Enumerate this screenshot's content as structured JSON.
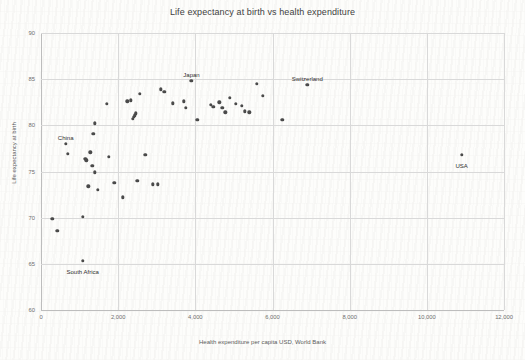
{
  "chart_data": {
    "type": "scatter",
    "title": "Life expectancy at birth vs health expenditure",
    "xlabel": "Health expenditure per capita USD, World Bank",
    "ylabel": "Life expectancy at birth",
    "xlim": [
      0,
      12000
    ],
    "ylim": [
      60,
      90
    ],
    "xticks": [
      0,
      2000,
      4000,
      6000,
      8000,
      10000,
      12000
    ],
    "xticklabels": [
      "0",
      "2,000",
      "4,000",
      "6,000",
      "8,000",
      "10,000",
      "12,000"
    ],
    "yticks": [
      60,
      65,
      70,
      75,
      80,
      85,
      90
    ],
    "yticklabels": [
      "60",
      "65",
      "70",
      "75",
      "80",
      "85",
      "90"
    ],
    "grid": true,
    "legend": false,
    "marker_color": "#4a4a4a",
    "grid_color": "#d9d9d9",
    "points": [
      {
        "x": 290,
        "y": 69.9
      },
      {
        "x": 420,
        "y": 68.6
      },
      {
        "x": 640,
        "y": 78.0
      },
      {
        "x": 700,
        "y": 76.9
      },
      {
        "x": 1080,
        "y": 70.1
      },
      {
        "x": 1080,
        "y": 65.3
      },
      {
        "x": 1150,
        "y": 76.4
      },
      {
        "x": 1170,
        "y": 76.2
      },
      {
        "x": 1230,
        "y": 73.4
      },
      {
        "x": 1280,
        "y": 77.1
      },
      {
        "x": 1330,
        "y": 75.6
      },
      {
        "x": 1360,
        "y": 79.1
      },
      {
        "x": 1390,
        "y": 80.2
      },
      {
        "x": 1400,
        "y": 74.9
      },
      {
        "x": 1480,
        "y": 73.0
      },
      {
        "x": 1700,
        "y": 82.3
      },
      {
        "x": 1760,
        "y": 76.6
      },
      {
        "x": 1900,
        "y": 73.8
      },
      {
        "x": 2120,
        "y": 72.2
      },
      {
        "x": 2240,
        "y": 82.6
      },
      {
        "x": 2320,
        "y": 82.7
      },
      {
        "x": 2380,
        "y": 80.7
      },
      {
        "x": 2400,
        "y": 80.9
      },
      {
        "x": 2430,
        "y": 81.1
      },
      {
        "x": 2460,
        "y": 81.3
      },
      {
        "x": 2500,
        "y": 74.0
      },
      {
        "x": 2560,
        "y": 83.4
      },
      {
        "x": 2700,
        "y": 76.8
      },
      {
        "x": 2900,
        "y": 73.6
      },
      {
        "x": 3020,
        "y": 73.6
      },
      {
        "x": 3100,
        "y": 83.9
      },
      {
        "x": 3200,
        "y": 83.6
      },
      {
        "x": 3420,
        "y": 82.4
      },
      {
        "x": 3700,
        "y": 82.6
      },
      {
        "x": 3760,
        "y": 81.9
      },
      {
        "x": 3900,
        "y": 84.8
      },
      {
        "x": 4050,
        "y": 80.6
      },
      {
        "x": 4400,
        "y": 82.2
      },
      {
        "x": 4470,
        "y": 82.0
      },
      {
        "x": 4620,
        "y": 82.5
      },
      {
        "x": 4700,
        "y": 81.9
      },
      {
        "x": 4780,
        "y": 81.4
      },
      {
        "x": 4900,
        "y": 83.0
      },
      {
        "x": 5050,
        "y": 82.3
      },
      {
        "x": 5200,
        "y": 82.1
      },
      {
        "x": 5280,
        "y": 81.5
      },
      {
        "x": 5400,
        "y": 81.4
      },
      {
        "x": 5600,
        "y": 84.5
      },
      {
        "x": 5750,
        "y": 83.2
      },
      {
        "x": 6250,
        "y": 80.6
      },
      {
        "x": 6900,
        "y": 84.4
      },
      {
        "x": 10900,
        "y": 76.8
      }
    ],
    "annotations": [
      {
        "text": "China",
        "x": 640,
        "y": 78.0,
        "dx": 0,
        "dy": -9
      },
      {
        "text": "Japan",
        "x": 3900,
        "y": 84.8,
        "dx": 0,
        "dy": -9
      },
      {
        "text": "Switzerland",
        "x": 6900,
        "y": 84.4,
        "dx": 0,
        "dy": -9
      },
      {
        "text": "USA",
        "x": 10900,
        "y": 76.8,
        "dx": 0,
        "dy": 8
      },
      {
        "text": "South Africa",
        "x": 1080,
        "y": 65.3,
        "dx": 0,
        "dy": 8
      }
    ]
  }
}
